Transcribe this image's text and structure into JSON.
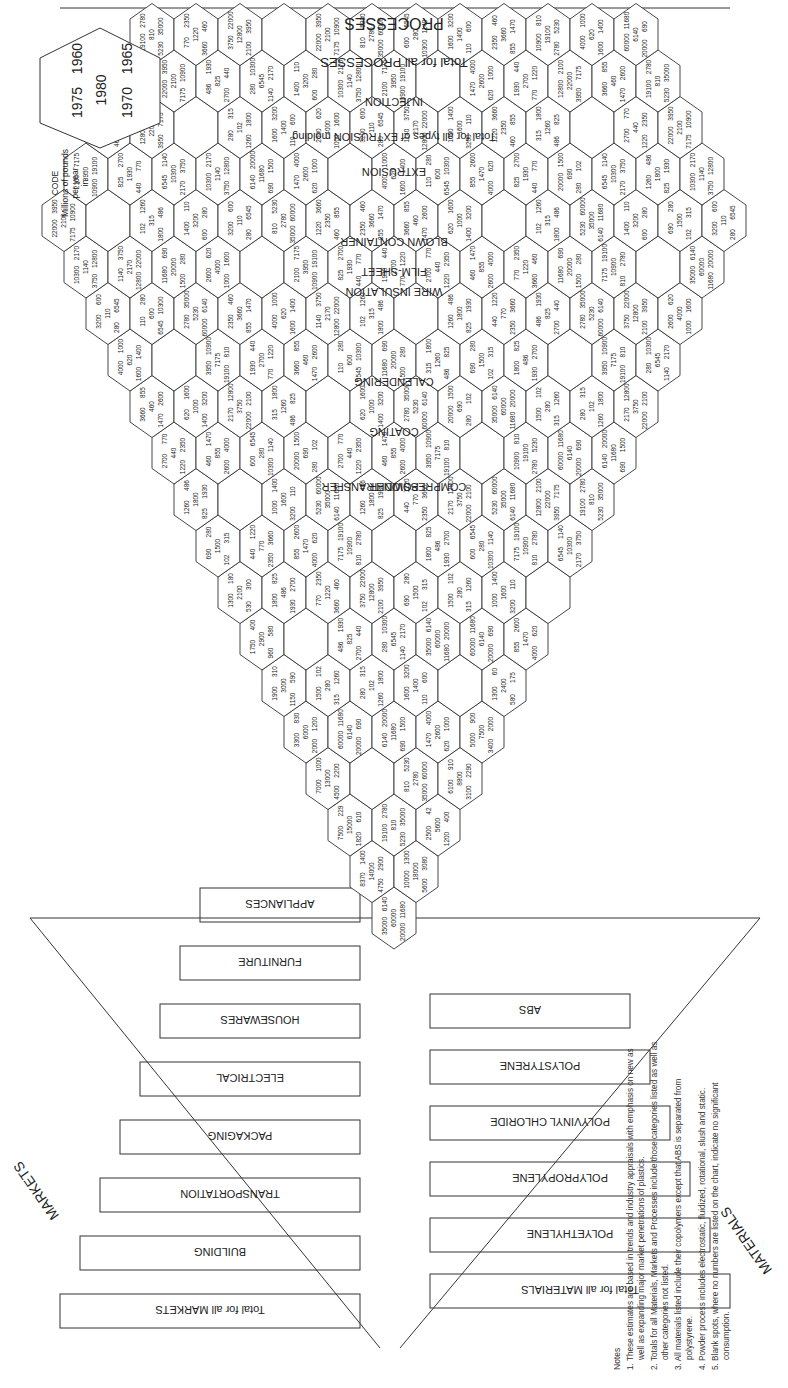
{
  "chart_data": {
    "type": "table",
    "subtitle": "Hexagonal cell chart, millions of pounds per year",
    "code_legend": {
      "title": "CODE",
      "caption": [
        "Millions of pounds",
        "per year",
        "in"
      ],
      "positions": {
        "top_left": "1975",
        "center": "1980",
        "top_right": "1960",
        "bottom_left": "1970",
        "bottom_right": "1965"
      }
    },
    "materials_label": "MATERIALS",
    "markets_label": "MARKETS",
    "processes_label": "PROCESSES",
    "materials": [
      "Total for all MATERIALS",
      "POLYETHYLENE",
      "POLYPROPYLENE",
      "POLYVINYL CHLORIDE",
      "POLYSTYRENE",
      "ABS"
    ],
    "markets": [
      "Total for all MARKETS",
      "BUILDING",
      "TRANSPORTATION",
      "PACKAGING",
      "ELECTRICAL",
      "HOUSEWARES",
      "FURNITURE",
      "APPLIANCES"
    ],
    "processes": [
      "Total for all PROCESSES",
      "INJECTION",
      "EXTRUSION",
      "Total for all types of EXTRUSION molding",
      "FILM-SHEET",
      "BLOWN CONTAINER",
      "WIRE INSULATION",
      "CALENDERING",
      "COATING",
      "COMPRESSION TRANSFER",
      "POWDER"
    ],
    "grand_total_cell": {
      "1975": "35000",
      "1980": "60000",
      "1960": "6140",
      "1970": "20000",
      "1965": "11680"
    },
    "material_totals": [
      {
        "material": "POLYETHYLENE",
        "1975": "10000",
        "1980": "18000",
        "1960": "1300",
        "1970": "5600",
        "1965": "3080"
      },
      {
        "material": "POLYPROPYLENE",
        "1975": "2500",
        "1980": "5600",
        "1960": "42",
        "1970": "1200",
        "1965": "400"
      },
      {
        "material": "POLYVINYL CHLORIDE",
        "1975": "6100",
        "1980": "8800",
        "1960": "910",
        "1970": "3100",
        "1965": "2290"
      },
      {
        "material": "POLYSTYRENE",
        "1975": "5000",
        "1980": "7500",
        "1960": "900",
        "1970": "3400",
        "1965": "2000"
      },
      {
        "material": "ABS",
        "1975": "1300",
        "1980": "2400",
        "1960": "60",
        "1970": "580",
        "1965": "175"
      }
    ],
    "market_totals": [
      {
        "market": "BUILDING",
        "1975": "8370",
        "1980": "14000",
        "1960": "1400",
        "1970": "4750",
        "1965": "2900"
      },
      {
        "market": "TRANSPORTATION",
        "1975": "7500",
        "1980": "15000",
        "1960": "229",
        "1970": "1820",
        "1965": "610"
      },
      {
        "market": "PACKAGING",
        "1975": "7000",
        "1980": "13000",
        "1960": "1000",
        "1970": "4500",
        "1965": "2200"
      },
      {
        "market": "ELECTRICAL",
        "1975": "3300",
        "1980": "6000",
        "1960": "830",
        "1970": "2000",
        "1965": "1200"
      },
      {
        "market": "HOUSEWARES",
        "1975": "1900",
        "1980": "3000",
        "1960": "310",
        "1970": "1150",
        "1965": "590"
      },
      {
        "market": "FURNITURE",
        "1975": "1750",
        "1980": "2900",
        "1960": "400",
        "1970": "960",
        "1965": "580"
      },
      {
        "market": "APPLIANCES",
        "1975": "1300",
        "1980": "2100",
        "1960": "180",
        "1970": "530",
        "1965": "300"
      }
    ],
    "process_totals_sample": [
      {
        "process": "Total for all PROCESSES",
        "1975": "35000",
        "1980": "60000",
        "1960": "6140",
        "1970": "20000",
        "1965": "11680"
      },
      {
        "process": "INJECTION",
        "1975": "10900",
        "1980": "19100",
        "1960": "810",
        "1970": "5230",
        "1965": "2780"
      },
      {
        "process": "EXTRUSION total",
        "1975": "12800",
        "1980": "22000",
        "1960": "2100",
        "1970": "7175",
        "1965": "3950"
      }
    ],
    "sample_cells_top_corner": [
      [
        "6545",
        "10300",
        "1140",
        "3750",
        "2170"
      ],
      [
        "1400",
        "3200",
        "110",
        "600",
        "280"
      ],
      [
        "1330",
        "3150",
        "690",
        "2100",
        "268"
      ]
    ],
    "grid": false,
    "legend_position": "top-right"
  },
  "notes": {
    "heading": "Notes",
    "items": [
      "1. These estimates are based in trends and industry appraisals with emphasis on new as well as expanding major market penetrations of plastics.",
      "2. Totals for all Materials, Markets and Processes include those categories listed as well as other categories not listed.",
      "3. All materials listed include their copolymers except that ABS is separated from polystyrene.",
      "4. Powder process includes electrostatic, fluidized, rotational, slush and static.",
      "5. Blank spots, where no numbers are listed on the chart, indicate no significant consumption."
    ]
  },
  "hex_values": {
    "row_a": [
      "690",
      "1500",
      "280",
      "102",
      "315",
      "1260",
      "1800",
      "486",
      "825"
    ],
    "row_b": [
      "1930",
      "2700",
      "440",
      "770",
      "1220",
      "2350",
      "3660",
      "460",
      "855",
      "1470"
    ],
    "row_c": [
      "2600",
      "4000",
      "620",
      "1000",
      "1600",
      "1400",
      "3200",
      "110",
      "600",
      "280"
    ],
    "row_d": [
      "6545",
      "10300",
      "1140",
      "2170",
      "3750",
      "12800",
      "22000",
      "2100",
      "3950",
      "7175"
    ],
    "row_e": [
      "10900",
      "19100",
      "810",
      "2780",
      "5230",
      "35000",
      "60000",
      "6140",
      "11680",
      "20000"
    ]
  }
}
